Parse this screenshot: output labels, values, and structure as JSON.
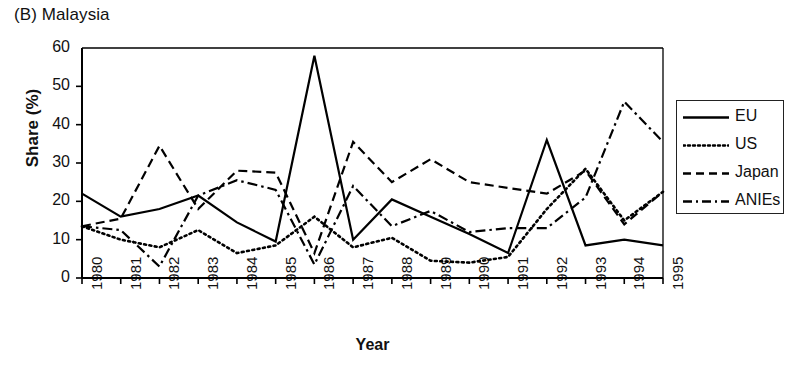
{
  "chart_data": {
    "type": "line",
    "title": "(B) Malaysia",
    "xlabel": "Year",
    "ylabel": "Share (%)",
    "grid": false,
    "legend_position": "right-outside",
    "xlim": [
      1980,
      1995
    ],
    "ylim": [
      0,
      60
    ],
    "ytick_values": [
      0,
      10,
      20,
      30,
      40,
      50,
      60
    ],
    "ytick_labels": [
      "0",
      "10",
      "20",
      "30",
      "40",
      "50",
      "60"
    ],
    "categories": [
      1980,
      1981,
      1982,
      1983,
      1984,
      1985,
      1986,
      1987,
      1988,
      1989,
      1990,
      1991,
      1992,
      1993,
      1994,
      1995
    ],
    "xtick_labels": [
      "1980",
      "1981",
      "1982",
      "1983",
      "1984",
      "1985",
      "1986",
      "1987",
      "1988",
      "1989",
      "1990",
      "1991",
      "1992",
      "1993",
      "1994",
      "1995"
    ],
    "series": [
      {
        "name": "EU",
        "style": "solid",
        "color": "#000000",
        "values": [
          22.0,
          16.0,
          18.0,
          21.5,
          14.5,
          9.5,
          58.0,
          10.0,
          20.5,
          16.0,
          11.5,
          6.5,
          36.0,
          8.5,
          10.0,
          8.5
        ]
      },
      {
        "name": "US",
        "style": "dotted",
        "color": "#000000",
        "values": [
          13.5,
          10.0,
          8.0,
          12.5,
          6.5,
          8.5,
          16.0,
          8.0,
          10.5,
          4.5,
          4.0,
          5.5,
          18.0,
          28.5,
          15.0,
          22.5
        ]
      },
      {
        "name": "Japan",
        "style": "dashed",
        "color": "#000000",
        "values": [
          13.5,
          15.5,
          34.5,
          18.0,
          28.0,
          27.5,
          6.5,
          35.5,
          25.0,
          31.0,
          25.0,
          23.5,
          22.0,
          28.0,
          14.0,
          22.5
        ]
      },
      {
        "name": "ANIEs",
        "style": "dashdot",
        "color": "#000000",
        "values": [
          13.5,
          12.5,
          3.0,
          21.5,
          25.5,
          23.0,
          3.5,
          24.0,
          13.5,
          17.5,
          12.0,
          13.0,
          13.0,
          21.0,
          46.0,
          35.5
        ]
      }
    ]
  },
  "legend": {
    "items": [
      {
        "label": "EU"
      },
      {
        "label": "US"
      },
      {
        "label": "Japan"
      },
      {
        "label": "ANIEs"
      }
    ]
  }
}
